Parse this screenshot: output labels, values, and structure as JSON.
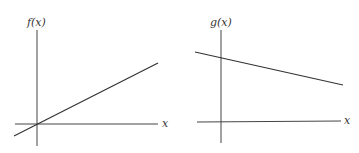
{
  "graphs": [
    {
      "name": "f-graph",
      "y_label": "f(x)",
      "x_label": "x",
      "description": "increasing line through origin"
    },
    {
      "name": "g-graph",
      "y_label": "g(x)",
      "x_label": "x",
      "description": "decreasing line with positive y-intercept"
    }
  ],
  "colors": {
    "line": "#333333",
    "axis": "#444444",
    "background": "#ffffff"
  }
}
